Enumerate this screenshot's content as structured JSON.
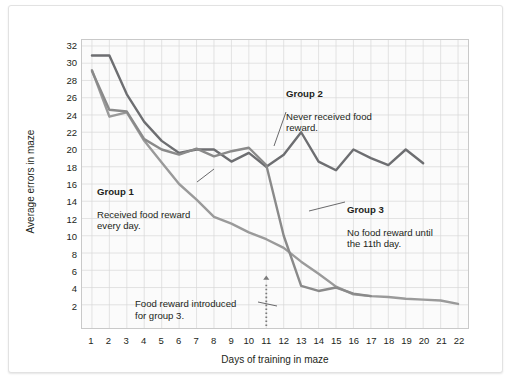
{
  "chart_data": {
    "type": "line",
    "title": "",
    "xlabel": "Days of training in maze",
    "ylabel": "Average errors in maze",
    "xlim": [
      1,
      22
    ],
    "ylim": [
      0,
      32
    ],
    "grid": true,
    "legend_position": "inline-annotations",
    "x": [
      1,
      2,
      3,
      4,
      5,
      6,
      7,
      8,
      9,
      10,
      11,
      12,
      13,
      14,
      15,
      16,
      17,
      18,
      19,
      20,
      21,
      22
    ],
    "yticks": [
      2,
      4,
      6,
      8,
      10,
      12,
      14,
      16,
      18,
      20,
      22,
      24,
      26,
      28,
      30,
      32
    ],
    "xticks": [
      1,
      2,
      3,
      4,
      5,
      6,
      7,
      8,
      9,
      10,
      11,
      12,
      13,
      14,
      15,
      16,
      17,
      18,
      19,
      20,
      21,
      22
    ],
    "series": [
      {
        "name": "Group 1",
        "color": "#9a9a9a",
        "values": [
          29.2,
          23.8,
          24.3,
          21.0,
          18.5,
          16.0,
          14.2,
          12.2,
          11.4,
          10.4,
          9.6,
          8.6,
          7.0,
          5.6,
          4.1,
          3.2,
          3.0,
          2.9,
          2.7,
          2.6,
          2.5,
          2.1
        ]
      },
      {
        "name": "Group 2",
        "color": "#6d6e71",
        "values": [
          30.9,
          30.9,
          26.4,
          23.2,
          21.0,
          19.6,
          20.0,
          20.0,
          18.6,
          19.6,
          18.0,
          19.4,
          22.0,
          18.6,
          17.6,
          20.0,
          19.0,
          18.2,
          20.0,
          18.4,
          null,
          null
        ]
      },
      {
        "name": "Group 3",
        "color": "#8a8a8a",
        "values": [
          29.1,
          24.6,
          24.4,
          21.2,
          20.0,
          19.4,
          20.1,
          19.2,
          19.8,
          20.2,
          18.2,
          10.0,
          4.2,
          3.6,
          4.0,
          3.3,
          3.0,
          null,
          null,
          null,
          null,
          null
        ]
      }
    ],
    "annotations": [
      {
        "id": "group-1",
        "heading": "Group 1",
        "body": "Received food reward\never y day.",
        "text": "Received food reward\nevery day."
      },
      {
        "id": "group-2",
        "heading": "Group 2",
        "text": "Never received food\nreward."
      },
      {
        "id": "group-3",
        "heading": "Group 3",
        "text": "No food reward until\nthe 11th day."
      },
      {
        "id": "food-reward-marker",
        "heading": "",
        "text": "Food reward introduced\nfor group 3.",
        "marker_x": 11,
        "marker_style": "dotted-arrow-up"
      }
    ]
  },
  "axes": {
    "x_title": "Days of training in maze",
    "y_title": "Average errors in maze"
  },
  "annotations_text": {
    "group1_heading": "Group 1",
    "group1_body": "Received food reward\nevery day.",
    "group2_heading": "Group 2",
    "group2_body": "Never received food\nreward.",
    "group3_heading": "Group 3",
    "group3_body": "No food reward until\nthe 11th day.",
    "food_note": "Food reward introduced\nfor group 3."
  },
  "colors": {
    "group1": "#9a9a9a",
    "group2": "#6d6e71",
    "group3": "#8a8a8a",
    "grid": "#d8d8d8",
    "frame": "#c9c9c9",
    "text": "#231f20",
    "plot_bg": "#fbfbfb",
    "page_bg": "#ffffff"
  }
}
